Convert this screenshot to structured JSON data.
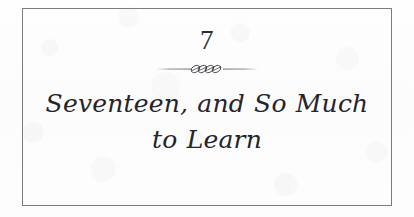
{
  "page": {
    "kind": "book-chapter-title-page",
    "background_color": "#fdfdfd",
    "frame_color": "#7b7b82",
    "text_color": "#24242a"
  },
  "chapter": {
    "number": "7",
    "ornament_name": "twisted-rope-rule-ornament",
    "title_lines": [
      "Seventeen, and So Much",
      "to Learn"
    ],
    "title_full": "Seventeen, and So Much to Learn"
  }
}
